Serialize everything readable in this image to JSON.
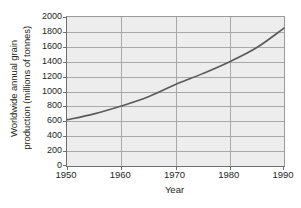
{
  "chart_data": {
    "type": "line",
    "title": "",
    "xlabel": "Year",
    "ylabel_lines": [
      "Worldwide annual grain",
      "production (millions of tonnes)"
    ],
    "ylabel": "Worldwide annual grain production (millions of tonnes)",
    "xlim": [
      1950,
      1990
    ],
    "ylim": [
      0,
      2000
    ],
    "xticks": [
      1950,
      1960,
      1970,
      1980,
      1990
    ],
    "xtick_labels": [
      "1950",
      "1960",
      "1970",
      "1980",
      "1990"
    ],
    "yticks": [
      0,
      200,
      400,
      600,
      800,
      1000,
      1200,
      1400,
      1600,
      1800,
      2000
    ],
    "ytick_labels": [
      "0",
      "200",
      "400",
      "600",
      "800",
      "1000",
      "1200",
      "1400",
      "1600",
      "1800",
      "2000"
    ],
    "grid": "horizontal-and-vertical",
    "legend": "none",
    "series": [
      {
        "name": "Worldwide annual grain production",
        "x": [
          1950,
          1955,
          1960,
          1965,
          1970,
          1975,
          1980,
          1985,
          1990
        ],
        "values": [
          620,
          700,
          805,
          930,
          1095,
          1240,
          1400,
          1590,
          1850
        ]
      }
    ],
    "colors": {
      "line": "#5a5a5a",
      "plot_background": "#ededed",
      "gridlines": "#a9a9a9",
      "axis": "#6d6e70",
      "text": "#231f20",
      "page_background": "#ffffff"
    }
  }
}
